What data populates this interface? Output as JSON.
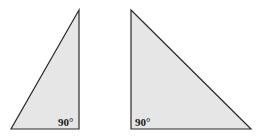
{
  "diagram": {
    "fill_color": "#e6e6e6",
    "stroke_color": "#2a2a2a",
    "triangles": [
      {
        "name": "left-triangle",
        "points": "79,10 11,129 79,129",
        "angle_label": "90°",
        "label_x": 58,
        "label_y": 126
      },
      {
        "name": "right-triangle",
        "points": "131,10 131,129 251,129",
        "angle_label": "90°",
        "label_x": 135,
        "label_y": 126
      }
    ]
  }
}
